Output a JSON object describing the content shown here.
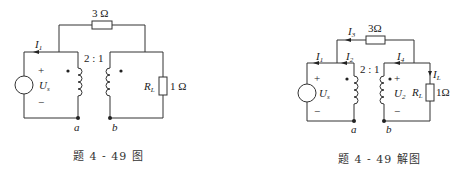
{
  "figure_left": {
    "caption": "题 4 - 49 图",
    "transformer_ratio": "2 : 1",
    "resistor_top": "3 Ω",
    "load_label": "R",
    "load_sub": "L",
    "load_value": "1 Ω",
    "source_label": "U",
    "source_sub": "s",
    "current_i1": "I",
    "current_i1_sub": "1",
    "plus": "+",
    "minus": "−",
    "node_a": "a",
    "node_b": "b"
  },
  "figure_right": {
    "caption": "题 4 - 49 解图",
    "transformer_ratio": "2 : 1",
    "resistor_top": "3Ω",
    "load_label": "R",
    "load_sub": "L",
    "load_value": "1Ω",
    "source_label": "U",
    "source_sub": "s",
    "secondary_voltage": "U",
    "secondary_voltage_sub": "2",
    "currents": [
      {
        "label": "I",
        "sub": "1"
      },
      {
        "label": "I",
        "sub": "2"
      },
      {
        "label": "I",
        "sub": "3"
      },
      {
        "label": "I",
        "sub": "4"
      },
      {
        "label": "I",
        "sub": "L"
      }
    ],
    "plus": "+",
    "minus": "−",
    "node_a": "a",
    "node_b": "b"
  },
  "colors": {
    "wire": "#333333",
    "text": "#222222",
    "background": "#ffffff"
  }
}
